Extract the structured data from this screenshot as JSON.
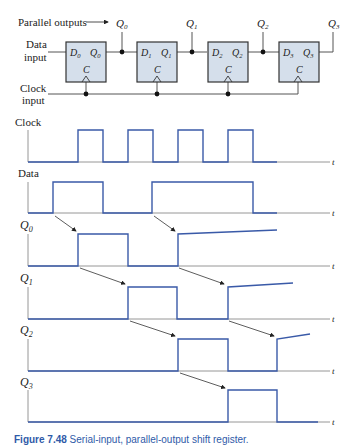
{
  "circuit": {
    "parallel_outputs_label": "Parallel outputs",
    "data_input_label": [
      "Data",
      "input"
    ],
    "clock_input_label": [
      "Clock",
      "input"
    ],
    "flipflops": [
      {
        "d": "D",
        "d_sub": "0",
        "q": "Q",
        "q_sub": "0",
        "c": "C",
        "out": "Q",
        "out_sub": "0"
      },
      {
        "d": "D",
        "d_sub": "1",
        "q": "Q",
        "q_sub": "1",
        "c": "C",
        "out": "Q",
        "out_sub": "1"
      },
      {
        "d": "D",
        "d_sub": "2",
        "q": "Q",
        "q_sub": "2",
        "c": "C",
        "out": "Q",
        "out_sub": "2"
      },
      {
        "d": "D",
        "d_sub": "3",
        "q": "Q",
        "q_sub": "3",
        "c": "C",
        "out": "Q",
        "out_sub": "3"
      }
    ],
    "colors": {
      "box_fill": "#d5dfeb",
      "box_stroke": "#333333",
      "wire": "#555555"
    }
  },
  "timing": {
    "time_axis_label": "t",
    "signals": [
      {
        "name": "Clock",
        "sub": ""
      },
      {
        "name": "Data",
        "sub": ""
      },
      {
        "name": "Q",
        "sub": "0"
      },
      {
        "name": "Q",
        "sub": "1"
      },
      {
        "name": "Q",
        "sub": "2"
      },
      {
        "name": "Q",
        "sub": "3"
      }
    ],
    "colors": {
      "waveform": "#3a5aa8",
      "axis": "#888888",
      "arrow": "#333333"
    }
  },
  "caption": {
    "label": "Figure 7.48",
    "text": "Serial-input, parallel-output shift register."
  }
}
